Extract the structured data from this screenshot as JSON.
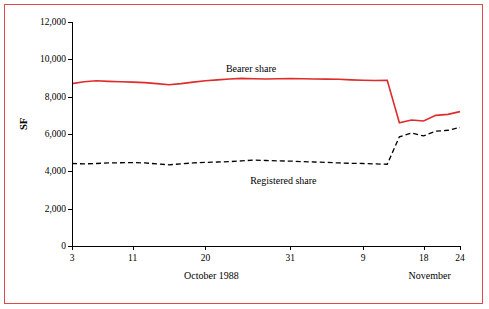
{
  "chart_data": {
    "type": "line",
    "title": "",
    "xlabel": "",
    "ylabel": "SF",
    "ylim": [
      0,
      12000
    ],
    "yticks": [
      0,
      2000,
      4000,
      6000,
      8000,
      10000,
      12000
    ],
    "ytick_labels": [
      "0",
      "2,000",
      "4,000",
      "6,000",
      "8,000",
      "10,000",
      "12,000"
    ],
    "xticks": [
      3,
      11,
      20,
      31,
      9,
      18,
      24
    ],
    "xtick_labels": [
      "3",
      "11",
      "20",
      "31",
      "9",
      "18",
      "24"
    ],
    "x_group_labels": [
      {
        "label": "October 1988",
        "x": 17
      },
      {
        "label": "November",
        "x": 14
      }
    ],
    "grid": false,
    "legend_position": "inline",
    "series": [
      {
        "name": "Bearer share",
        "color": "#e02b2b",
        "style": "solid",
        "label_x": 15.5,
        "label_y": 9450,
        "x": [
          0,
          1,
          2,
          3,
          4,
          5,
          6,
          7,
          8,
          9,
          10,
          11,
          12,
          13,
          14,
          15,
          16,
          17,
          18,
          19,
          20,
          21,
          22,
          23,
          24,
          25,
          26,
          27,
          28,
          29,
          30,
          31,
          32
        ],
        "values": [
          8700,
          8800,
          8850,
          8820,
          8800,
          8780,
          8750,
          8700,
          8640,
          8700,
          8780,
          8850,
          8900,
          8950,
          8980,
          8960,
          8950,
          8960,
          8970,
          8960,
          8950,
          8940,
          8930,
          8900,
          8880,
          8870,
          8880,
          6600,
          6750,
          6700,
          7000,
          7050,
          7200
        ]
      },
      {
        "name": "Registered share",
        "color": "#000000",
        "style": "dashed",
        "label_x": 17.5,
        "label_y": 3450,
        "x": [
          0,
          1,
          2,
          3,
          4,
          5,
          6,
          7,
          8,
          9,
          10,
          11,
          12,
          13,
          14,
          15,
          16,
          17,
          18,
          19,
          20,
          21,
          22,
          23,
          24,
          25,
          26,
          27,
          28,
          29,
          30,
          31,
          32
        ],
        "values": [
          4420,
          4400,
          4420,
          4450,
          4460,
          4470,
          4450,
          4400,
          4350,
          4400,
          4450,
          4480,
          4500,
          4520,
          4560,
          4600,
          4580,
          4560,
          4550,
          4520,
          4500,
          4480,
          4450,
          4430,
          4420,
          4400,
          4380,
          5850,
          6050,
          5900,
          6150,
          6200,
          6350
        ]
      }
    ]
  }
}
